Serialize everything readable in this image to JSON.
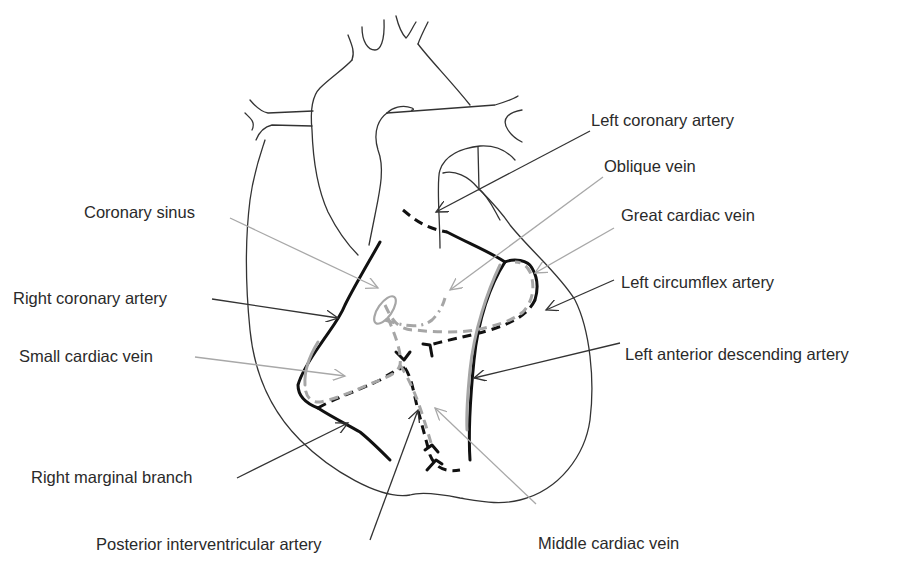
{
  "diagram": {
    "labels": {
      "left_coronary_artery": "Left coronary artery",
      "oblique_vein": "Oblique vein",
      "great_cardiac_vein": "Great cardiac vein",
      "left_circumflex_artery": "Left circumflex artery",
      "left_anterior_descending_artery": "Left anterior descending artery",
      "middle_cardiac_vein": "Middle cardiac vein",
      "posterior_interventricular_artery": "Posterior interventricular artery",
      "right_marginal_branch": "Right marginal branch",
      "small_cardiac_vein": "Small cardiac vein",
      "right_coronary_artery": "Right coronary artery",
      "coronary_sinus": "Coronary sinus"
    },
    "legend_styles": {
      "artery_color": "#111111",
      "vein_color": "#a6a6a6",
      "outline_color": "#333333",
      "background": "#ffffff"
    }
  }
}
